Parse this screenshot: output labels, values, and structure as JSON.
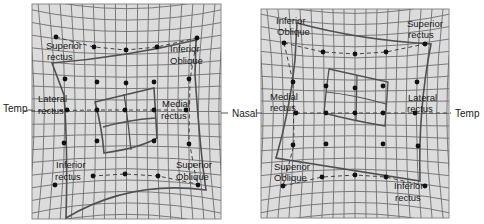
{
  "figure": {
    "colors": {
      "background": "#ffffff",
      "grid_bg": "#dcdcdc",
      "grid_line": "#6e6e6e",
      "outline": "#505050",
      "dot": "#111111"
    }
  },
  "direction_labels": {
    "left_temp": "Temp",
    "nasal": "Nasal",
    "right_temp": "Temp"
  },
  "left_panel": {
    "labels": {
      "superior_rectus_1": "Superior",
      "superior_rectus_2": "rectus",
      "inferior_oblique_1": "Inferior",
      "inferior_oblique_2": "Oblique",
      "lateral_rectus_1": "Lateral",
      "lateral_rectus_2": "rectus",
      "medial_rectus_1": "Medial",
      "medial_rectus_2": "rectus",
      "inferior_rectus_1": "Inferior",
      "inferior_rectus_2": "rectus",
      "superior_oblique_1": "Superior",
      "superior_oblique_2": "Oblique"
    }
  },
  "right_panel": {
    "labels": {
      "inferior_oblique_1": "Inferior",
      "inferior_oblique_2": "Oblique",
      "superior_rectus_1": "Superior",
      "superior_rectus_2": "rectus",
      "medial_rectus_1": "Medial",
      "medial_rectus_2": "rectus",
      "lateral_rectus_1": "Lateral",
      "lateral_rectus_2": "rectus",
      "superior_oblique_1": "Superior",
      "superior_oblique_2": "Oblique",
      "inferior_rectus_1": "Inferior",
      "inferior_rectus_2": "rectus"
    }
  }
}
